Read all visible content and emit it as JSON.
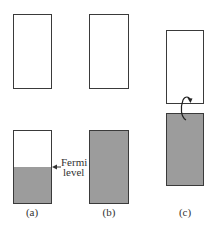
{
  "diagram": {
    "panels": [
      {
        "label": "(a)",
        "upper_band": {
          "filled_fraction": 0
        },
        "lower_band": {
          "filled_fraction": 0.5
        }
      },
      {
        "label": "(b)",
        "upper_band": {
          "filled_fraction": 0
        },
        "lower_band": {
          "filled_fraction": 1.0
        }
      },
      {
        "label": "(c)",
        "upper_band": {
          "filled_fraction": 0
        },
        "lower_band": {
          "filled_fraction": 1.0
        },
        "arrow": "electron excitation from lower band to upper band"
      }
    ],
    "annotation": {
      "line1": "Fermi",
      "line2": "level"
    },
    "colors": {
      "fill": "#9c9c9c",
      "border": "#3a3a3a",
      "background": "#ffffff"
    }
  }
}
